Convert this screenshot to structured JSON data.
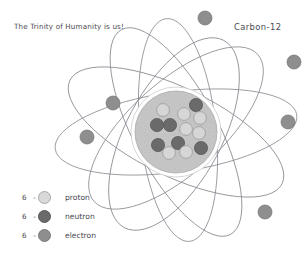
{
  "title": "The Trinity of Humanity is us!",
  "element_label": "Carbon-12",
  "legend": {
    "rows": [
      {
        "count": "6",
        "dash": "-",
        "label": "proton",
        "swatch": "proton-swatch",
        "color": "#d9d9d9"
      },
      {
        "count": "6",
        "dash": "-",
        "label": "neutron",
        "swatch": "neutron-swatch",
        "color": "#6a6a6a"
      },
      {
        "count": "6",
        "dash": "-",
        "label": "electron",
        "swatch": "electron-swatch",
        "color": "#8e8e8e"
      }
    ]
  },
  "colors": {
    "background": "#ffffff",
    "ink": "#4a4a52",
    "orbit_line": "#8a8a92",
    "nucleus_fill": "#c9c9c9",
    "nucleus_halo": "#ffffff",
    "proton_fill": "#d9d9d9",
    "proton_stroke": "#9a9a9a",
    "neutron_fill": "#6a6a6a",
    "neutron_stroke": "#545454",
    "electron_fill": "#8e8e8e",
    "electron_stroke": "#707070"
  },
  "diagram": {
    "type": "atom-model",
    "element": "Carbon-12",
    "nucleus": {
      "center_x": 176,
      "center_y": 132,
      "radius": 41,
      "halo_radius": 45
    },
    "protons": [
      {
        "cx": 163,
        "cy": 110,
        "r": 6.4
      },
      {
        "cx": 184,
        "cy": 114,
        "r": 6.4
      },
      {
        "cx": 200,
        "cy": 118,
        "r": 6.4
      },
      {
        "cx": 186,
        "cy": 129,
        "r": 6.4
      },
      {
        "cx": 199,
        "cy": 133,
        "r": 6.4
      },
      {
        "cx": 169,
        "cy": 153,
        "r": 6.4
      },
      {
        "cx": 186,
        "cy": 152,
        "r": 6.4
      }
    ],
    "neutrons": [
      {
        "cx": 196,
        "cy": 105,
        "r": 6.6
      },
      {
        "cx": 157,
        "cy": 125,
        "r": 6.6
      },
      {
        "cx": 170,
        "cy": 125,
        "r": 6.6
      },
      {
        "cx": 158,
        "cy": 145,
        "r": 6.6
      },
      {
        "cx": 178,
        "cy": 143,
        "r": 6.6
      },
      {
        "cx": 201,
        "cy": 148,
        "r": 6.6
      }
    ],
    "electrons": [
      {
        "cx": 205,
        "cy": 18,
        "r": 7.0
      },
      {
        "cx": 294,
        "cy": 62,
        "r": 7.0
      },
      {
        "cx": 113,
        "cy": 103,
        "r": 7.0
      },
      {
        "cx": 288,
        "cy": 122,
        "r": 7.0
      },
      {
        "cx": 87,
        "cy": 137,
        "r": 7.0
      },
      {
        "cx": 265,
        "cy": 212,
        "r": 7.0
      }
    ],
    "orbits": [
      {
        "cx": 176,
        "cy": 132,
        "rx": 122,
        "ry": 40,
        "rotate": -8
      },
      {
        "cx": 176,
        "cy": 132,
        "rx": 118,
        "ry": 44,
        "rotate": 26
      },
      {
        "cx": 176,
        "cy": 132,
        "rx": 116,
        "ry": 42,
        "rotate": 62
      },
      {
        "cx": 176,
        "cy": 128,
        "rx": 110,
        "ry": 46,
        "rotate": -42
      },
      {
        "cx": 178,
        "cy": 130,
        "rx": 112,
        "ry": 38,
        "rotate": 84
      },
      {
        "cx": 174,
        "cy": 134,
        "rx": 106,
        "ry": 48,
        "rotate": 118
      }
    ]
  }
}
